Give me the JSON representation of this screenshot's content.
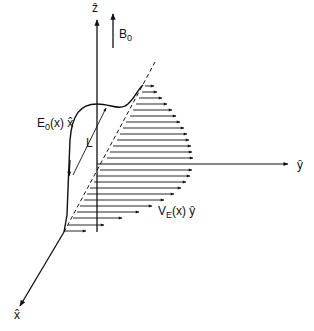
{
  "diagram": {
    "axes": {
      "z_label": "ẑ",
      "y_label": "ŷ",
      "x_label": "x̂"
    },
    "field_label": {
      "main": "B",
      "sub": "0"
    },
    "electric_field_label": {
      "main": "E",
      "sub": "0",
      "rest": "(x) x̂"
    },
    "velocity_label": {
      "main": "V",
      "sub": "E",
      "rest": "(x) ŷ"
    },
    "length_label": "L",
    "colors": {
      "ink": "#111111",
      "background": "#ffffff"
    }
  }
}
